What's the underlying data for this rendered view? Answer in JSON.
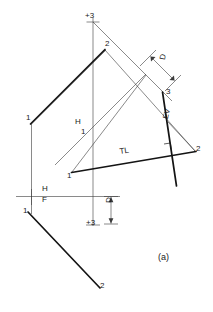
{
  "figure": {
    "caption": "(a)",
    "type": "descriptive-geometry-construction"
  },
  "labels": {
    "top_point_3": "+3",
    "bottom_point_3": "+3",
    "point_2_top": "2",
    "point_1_left_upper": "1",
    "point_1_mid_h": "1",
    "point_1_tl_start": "1",
    "point_1_front_left": "1",
    "point_2_right": "2",
    "point_2_bottom": "2",
    "point_3_right": "3",
    "point_3_lower": "3",
    "fold_h_upper": "H",
    "fold_1_upper": "1",
    "fold_h_ref": "H",
    "fold_f_ref": "F",
    "true_length": "TL",
    "edge_view": "EV",
    "dim_d_upper": "D",
    "dim_d_lower": "D",
    "rotated_2_near_ev": "2"
  },
  "style": {
    "ink": "#1a1a1a",
    "thin_line": "#3a3a3a",
    "background": "#ffffff",
    "bold_stroke_width": "1.7",
    "thin_stroke_width": "0.6"
  },
  "geometry": {
    "fold_line_hf": {
      "x1": 16,
      "y1": 197,
      "x2": 120,
      "y2": 196
    },
    "vertical_projector": {
      "x1": 93,
      "y1": 18,
      "x2": 93,
      "y2": 226
    },
    "tl_line": {
      "x1": 72,
      "y1": 172,
      "x2": 196,
      "y2": 152
    },
    "bold_upper_line": {
      "x1": 30,
      "y1": 124,
      "x2": 105,
      "y2": 49
    },
    "bold_lower_line": {
      "x1": 28,
      "y1": 212,
      "x2": 100,
      "y2": 288
    },
    "edge_view_line": {
      "x1": 163,
      "y1": 93,
      "x2": 176,
      "y2": 186
    }
  }
}
